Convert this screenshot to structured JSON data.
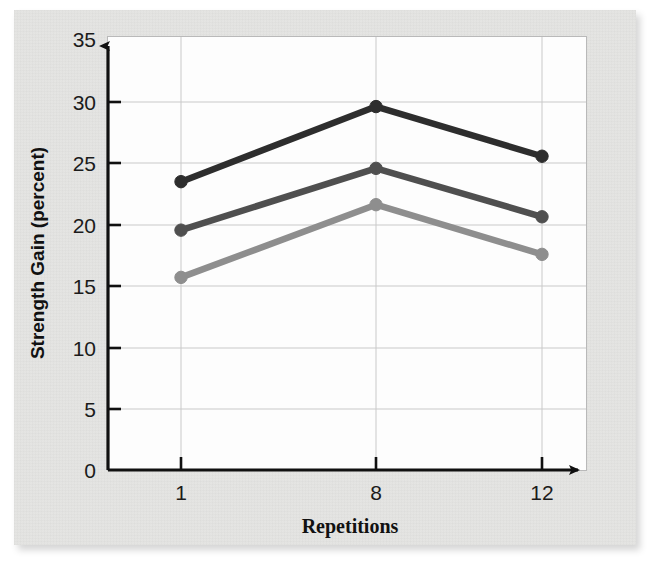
{
  "chart_data": {
    "type": "line",
    "title": "",
    "xlabel": "Repetitions",
    "ylabel": "Strength Gain (percent)",
    "categories": [
      "1",
      "8",
      "12"
    ],
    "x": [
      1,
      8,
      12
    ],
    "xtick_labels": [
      "1",
      "8",
      "12"
    ],
    "ytick_labels": [
      "0",
      "5",
      "10",
      "15",
      "20",
      "25",
      "30",
      "35"
    ],
    "yticks": [
      0,
      5,
      10,
      15,
      20,
      25,
      30,
      35
    ],
    "ylim": [
      0,
      35
    ],
    "grid": "horizontal-and-vertical-at-ticks",
    "legend": "none",
    "series": [
      {
        "name": "series-dark",
        "color": "#2d2d2d",
        "values": [
          23.8,
          30.0,
          25.9
        ]
      },
      {
        "name": "series-medium",
        "color": "#4f4f4f",
        "values": [
          19.8,
          24.9,
          20.9
        ]
      },
      {
        "name": "series-light",
        "color": "#8e8e8e",
        "values": [
          15.9,
          21.9,
          17.8
        ]
      }
    ]
  },
  "figure": {
    "axis_color": "#101010",
    "grid_color": "#c9c9c9",
    "panel_background": "#fdfdfd",
    "page_background": "#e3e3e1"
  }
}
